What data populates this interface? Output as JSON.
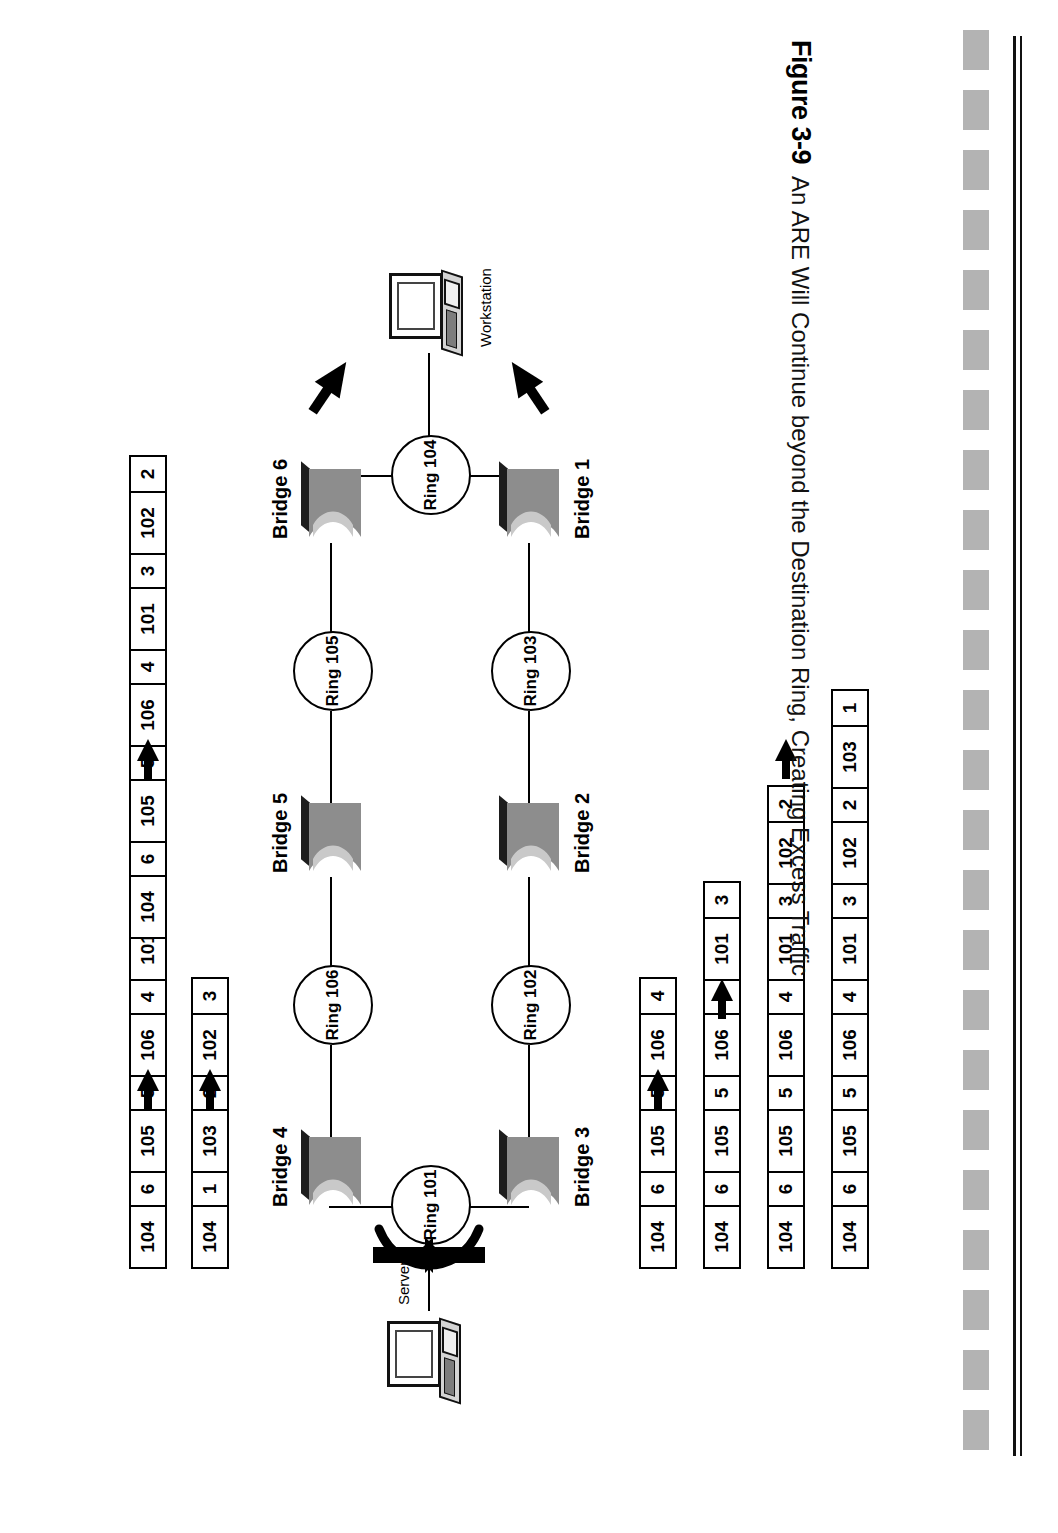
{
  "caption": {
    "figure_number": "Figure 3-9",
    "text": "An ARE Will Continue beyond the Destination Ring, Creating Excess Traffic"
  },
  "devices": [
    {
      "name": "server",
      "label": "Server"
    },
    {
      "name": "workstation",
      "label": "Workstation"
    }
  ],
  "rings": [
    {
      "id": "ring-101",
      "label": "Ring 101"
    },
    {
      "id": "ring-102",
      "label": "Ring 102"
    },
    {
      "id": "ring-103",
      "label": "Ring 103"
    },
    {
      "id": "ring-104",
      "label": "Ring 104"
    },
    {
      "id": "ring-105",
      "label": "Ring 105"
    },
    {
      "id": "ring-106",
      "label": "Ring 106"
    }
  ],
  "bridges": [
    {
      "id": "bridge-1",
      "label": "Bridge 1"
    },
    {
      "id": "bridge-2",
      "label": "Bridge 2"
    },
    {
      "id": "bridge-3",
      "label": "Bridge 3"
    },
    {
      "id": "bridge-4",
      "label": "Bridge 4"
    },
    {
      "id": "bridge-5",
      "label": "Bridge 5"
    },
    {
      "id": "bridge-6",
      "label": "Bridge 6"
    }
  ],
  "frames": [
    {
      "id": "frame-a",
      "branch": "left",
      "step": 1,
      "cells": [
        "104",
        "6",
        "105",
        "5",
        "106",
        "4"
      ]
    },
    {
      "id": "frame-b",
      "branch": "left",
      "step": 2,
      "cells": [
        "104",
        "6",
        "105",
        "5",
        "106",
        "4",
        "101",
        "3"
      ]
    },
    {
      "id": "frame-c",
      "branch": "left",
      "step": 3,
      "cells": [
        "104",
        "6",
        "105",
        "5",
        "106",
        "4",
        "101",
        "3",
        "102",
        "2"
      ]
    },
    {
      "id": "frame-d",
      "branch": "left",
      "step": 4,
      "cells": [
        "104",
        "6",
        "105",
        "5",
        "106",
        "4",
        "101",
        "3",
        "102",
        "2",
        "103",
        "1"
      ]
    },
    {
      "id": "frame-e",
      "branch": "right",
      "step": 1,
      "cells": [
        "104",
        "1",
        "103",
        "2",
        "102",
        "3"
      ]
    },
    {
      "id": "frame-f",
      "branch": "right",
      "step": 2,
      "cells": [
        "104",
        "6",
        "105",
        "5",
        "106",
        "4",
        "101",
        "3"
      ]
    },
    {
      "id": "frame-g",
      "branch": "right",
      "step": 3,
      "cells": [
        "104",
        "6",
        "105",
        "5",
        "106",
        "4",
        "101",
        "3",
        "102",
        "2"
      ]
    }
  ],
  "colors": {
    "bridge_body": "#8d8d8d",
    "bridge_highlight": "#c9c9c9",
    "bridge_top": "#1d1d1d",
    "line": "#000000",
    "dash_bar": "#b3b3b3"
  }
}
